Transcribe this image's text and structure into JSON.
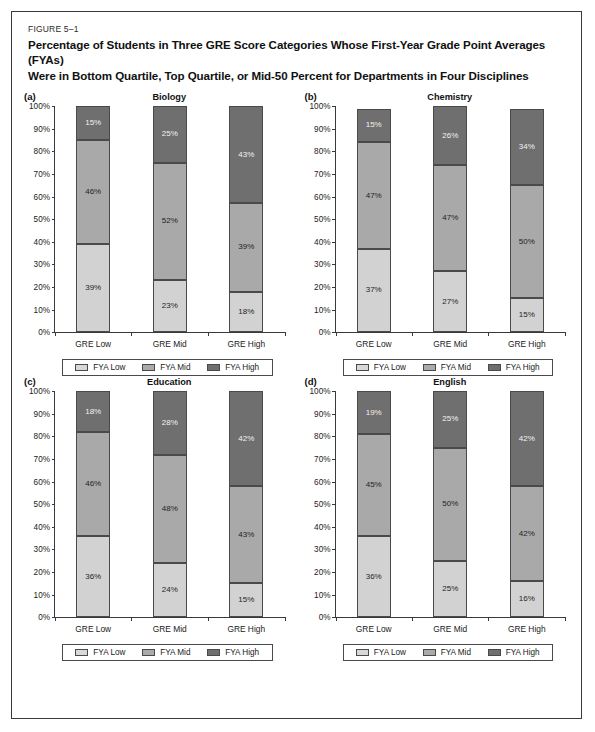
{
  "figure": {
    "number": "FIGURE 5–1",
    "title_line1": "Percentage of Students in Three GRE Score Categories Whose First-Year Grade Point Averages (FYAs)",
    "title_line2": "Were in Bottom Quartile, Top Quartile, or Mid-50 Percent for Departments in Four Disciplines"
  },
  "legend": {
    "items": [
      {
        "label": "FYA Low",
        "color": "#d8d8d8"
      },
      {
        "label": "FYA Mid",
        "color": "#aaaaaa"
      },
      {
        "label": "FYA High",
        "color": "#6f6f6f"
      }
    ]
  },
  "axis": {
    "yticks": [
      "100%",
      "90%",
      "80%",
      "70%",
      "60%",
      "50%",
      "40%",
      "30%",
      "20%",
      "10%",
      "0%"
    ],
    "ylim": [
      0,
      100
    ]
  },
  "chart_data": [
    {
      "type": "bar",
      "panel": "(a)",
      "title": "Biology",
      "stacked": true,
      "categories": [
        "GRE Low",
        "GRE Mid",
        "GRE High"
      ],
      "series": [
        {
          "name": "FYA Low",
          "values": [
            39,
            23,
            18
          ]
        },
        {
          "name": "FYA Mid",
          "values": [
            46,
            52,
            39
          ]
        },
        {
          "name": "FYA High",
          "values": [
            15,
            25,
            43
          ]
        }
      ],
      "labels": [
        [
          "39%",
          "46%",
          "15%"
        ],
        [
          "23%",
          "52%",
          "25%"
        ],
        [
          "18%",
          "39%",
          "43%"
        ]
      ],
      "xlabel": "",
      "ylabel": "",
      "ylim": [
        0,
        100
      ],
      "grid": false,
      "legend_position": "bottom"
    },
    {
      "type": "bar",
      "panel": "(b)",
      "title": "Chemistry",
      "stacked": true,
      "categories": [
        "GRE Low",
        "GRE Mid",
        "GRE High"
      ],
      "series": [
        {
          "name": "FYA Low",
          "values": [
            37,
            27,
            15
          ]
        },
        {
          "name": "FYA Mid",
          "values": [
            47,
            47,
            50
          ]
        },
        {
          "name": "FYA High",
          "values": [
            15,
            26,
            34
          ]
        }
      ],
      "labels": [
        [
          "37%",
          "47%",
          "15%"
        ],
        [
          "27%",
          "47%",
          "26%"
        ],
        [
          "15%",
          "50%",
          "34%"
        ]
      ],
      "xlabel": "",
      "ylabel": "",
      "ylim": [
        0,
        100
      ],
      "grid": false,
      "legend_position": "bottom"
    },
    {
      "type": "bar",
      "panel": "(c)",
      "title": "Education",
      "stacked": true,
      "categories": [
        "GRE Low",
        "GRE Mid",
        "GRE High"
      ],
      "series": [
        {
          "name": "FYA Low",
          "values": [
            36,
            24,
            15
          ]
        },
        {
          "name": "FYA Mid",
          "values": [
            46,
            48,
            43
          ]
        },
        {
          "name": "FYA High",
          "values": [
            18,
            28,
            42
          ]
        }
      ],
      "labels": [
        [
          "36%",
          "46%",
          "18%"
        ],
        [
          "24%",
          "48%",
          "28%"
        ],
        [
          "15%",
          "43%",
          "42%"
        ]
      ],
      "xlabel": "",
      "ylabel": "",
      "ylim": [
        0,
        100
      ],
      "grid": false,
      "legend_position": "bottom"
    },
    {
      "type": "bar",
      "panel": "(d)",
      "title": "English",
      "stacked": true,
      "categories": [
        "GRE Low",
        "GRE Mid",
        "GRE High"
      ],
      "series": [
        {
          "name": "FYA Low",
          "values": [
            36,
            25,
            16
          ]
        },
        {
          "name": "FYA Mid",
          "values": [
            45,
            50,
            42
          ]
        },
        {
          "name": "FYA High",
          "values": [
            19,
            25,
            42
          ]
        }
      ],
      "labels": [
        [
          "36%",
          "45%",
          "19%"
        ],
        [
          "25%",
          "50%",
          "25%"
        ],
        [
          "16%",
          "42%",
          "42%"
        ]
      ],
      "xlabel": "",
      "ylabel": "",
      "ylim": [
        0,
        100
      ],
      "grid": false,
      "legend_position": "bottom"
    }
  ]
}
